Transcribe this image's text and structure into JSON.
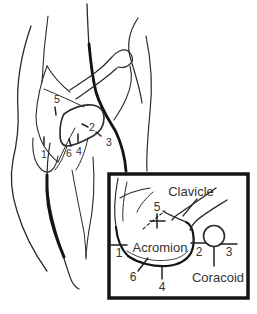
{
  "palette": {
    "ink": "#1f1f1f",
    "paper": "#ffffff"
  },
  "main_figure": {
    "landmarks": [
      {
        "label": "1"
      },
      {
        "label": "2"
      },
      {
        "label": "3"
      },
      {
        "label": "4"
      },
      {
        "label": "5"
      },
      {
        "label": "6"
      }
    ]
  },
  "inset": {
    "anatomy": {
      "clavicle": "Clavicle",
      "acromion": "Acromion",
      "coracoid": "Coracoid"
    },
    "landmarks": [
      {
        "label": "1"
      },
      {
        "label": "2"
      },
      {
        "label": "3"
      },
      {
        "label": "4"
      },
      {
        "label": "5"
      },
      {
        "label": "6"
      }
    ]
  }
}
